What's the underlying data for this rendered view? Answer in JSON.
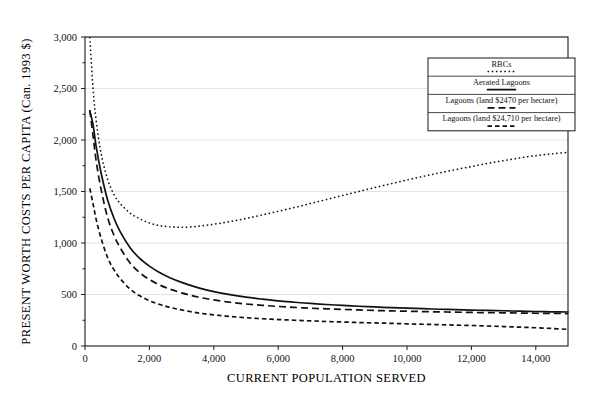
{
  "chart_data": {
    "type": "line",
    "title": "",
    "xlabel": "CURRENT POPULATION SERVED",
    "ylabel": "PRESENT WORTH COSTS PER CAPITA (Can. 1993 $)",
    "xlim": [
      0,
      15000
    ],
    "ylim": [
      0,
      3000
    ],
    "grid": true,
    "legend_position": "top-right",
    "xticks": [
      0,
      2000,
      4000,
      6000,
      8000,
      10000,
      12000,
      14000
    ],
    "xtick_labels": [
      "0",
      "2,000",
      "4,000",
      "6,000",
      "8,000",
      "10,000",
      "12,000",
      "14,000"
    ],
    "yticks": [
      0,
      500,
      1000,
      1500,
      2000,
      2500,
      3000
    ],
    "ytick_labels": [
      "0",
      "500",
      "1,000",
      "1,500",
      "2,000",
      "2,500",
      "3,000"
    ],
    "series": [
      {
        "name": "RBCs",
        "style": "dotted",
        "dash": "1.6,2.6",
        "width": 1.5,
        "x": [
          150,
          250,
          350,
          500,
          700,
          900,
          1100,
          1400,
          1700,
          2000,
          2300,
          2600,
          3000,
          3500,
          4000,
          4500,
          5000,
          5500,
          6000,
          6500,
          7000,
          7500,
          8000,
          8500,
          9000,
          9500,
          10000,
          10500,
          11000,
          11500,
          12000,
          12500,
          13000,
          13500,
          14000,
          14500,
          15000
        ],
        "y": [
          3000,
          2500,
          2180,
          1870,
          1620,
          1470,
          1380,
          1290,
          1235,
          1195,
          1170,
          1158,
          1152,
          1162,
          1182,
          1208,
          1238,
          1272,
          1308,
          1345,
          1383,
          1422,
          1462,
          1500,
          1538,
          1575,
          1612,
          1647,
          1680,
          1712,
          1742,
          1772,
          1800,
          1826,
          1848,
          1866,
          1880
        ]
      },
      {
        "name": "Aerated Lagoons",
        "style": "solid",
        "dash": "",
        "width": 1.7,
        "x": [
          150,
          250,
          350,
          500,
          700,
          900,
          1100,
          1400,
          1700,
          2000,
          2300,
          2600,
          3000,
          3500,
          4000,
          4500,
          5000,
          5500,
          6000,
          6500,
          7000,
          7500,
          8000,
          8500,
          9000,
          9500,
          10000,
          10500,
          11000,
          11500,
          12000,
          12500,
          13000,
          13500,
          14000,
          14500,
          15000
        ],
        "y": [
          2280,
          2150,
          1930,
          1680,
          1420,
          1240,
          1105,
          955,
          850,
          775,
          715,
          668,
          618,
          567,
          528,
          498,
          474,
          455,
          438,
          425,
          413,
          403,
          394,
          386,
          379,
          373,
          367,
          362,
          357,
          353,
          349,
          345,
          342,
          338,
          335,
          332,
          330
        ]
      },
      {
        "name": "Lagoons (land $2470 per hectare)",
        "style": "dashed",
        "dash": "7,4",
        "width": 1.7,
        "x": [
          150,
          250,
          350,
          500,
          700,
          900,
          1100,
          1400,
          1700,
          2000,
          2300,
          2600,
          3000,
          3500,
          4000,
          4500,
          5000,
          5500,
          6000,
          6500,
          7000,
          7500,
          8000,
          8500,
          9000,
          9500,
          10000,
          10500,
          11000,
          11500,
          12000,
          12500,
          13000,
          13500,
          14000,
          14500,
          15000
        ],
        "y": [
          2290,
          2040,
          1790,
          1520,
          1250,
          1075,
          950,
          805,
          712,
          645,
          595,
          556,
          516,
          476,
          447,
          425,
          408,
          395,
          384,
          375,
          367,
          361,
          355,
          350,
          345,
          341,
          338,
          334,
          331,
          329,
          326,
          324,
          322,
          320,
          318,
          316,
          315
        ]
      },
      {
        "name": "Lagoons (land $24,710 per hectare)",
        "style": "dashed-fine",
        "dash": "4.5,3",
        "width": 1.7,
        "x": [
          150,
          250,
          350,
          500,
          700,
          900,
          1100,
          1400,
          1700,
          2000,
          2300,
          2600,
          3000,
          3500,
          4000,
          4500,
          5000,
          5500,
          6000,
          6500,
          7000,
          7500,
          8000,
          8500,
          9000,
          9500,
          10000,
          10500,
          11000,
          11500,
          12000,
          12500,
          13000,
          13500,
          14000,
          14500,
          15000
        ],
        "y": [
          1530,
          1380,
          1225,
          1045,
          860,
          740,
          652,
          552,
          487,
          440,
          405,
          378,
          350,
          322,
          302,
          287,
          275,
          265,
          257,
          250,
          244,
          238,
          233,
          228,
          224,
          220,
          215,
          211,
          207,
          203,
          199,
          194,
          189,
          183,
          177,
          170,
          162
        ]
      }
    ]
  },
  "legend": {
    "entries": [
      {
        "label": "RBCs",
        "dash": "1.6,2.6",
        "width": 1.5
      },
      {
        "label": "Aerated Lagoons",
        "dash": "",
        "width": 1.7
      },
      {
        "label": "Lagoons (land $2470 per hectare)",
        "dash": "7,4",
        "width": 1.7
      },
      {
        "label": "Lagoons (land $24,710 per hectare)",
        "dash": "4.5,3",
        "width": 1.7
      }
    ]
  }
}
